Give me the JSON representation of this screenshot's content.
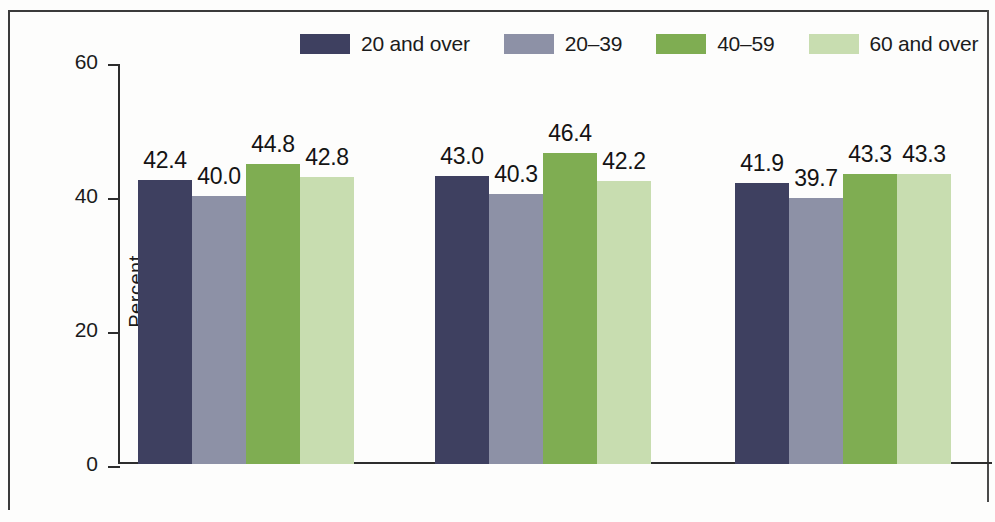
{
  "chart_data": {
    "type": "bar",
    "title": "",
    "subtitle": "",
    "xlabel": "",
    "ylabel": "Percent",
    "ylim": [
      0,
      60
    ],
    "yticks": [
      "0",
      "20",
      "40",
      "60"
    ],
    "ytick_values": [
      0,
      20,
      40,
      60
    ],
    "grid": false,
    "legend_position": "top",
    "categories": [
      "Total",
      "Men",
      "Women"
    ],
    "series": [
      {
        "name": "20 and over",
        "color": "#3e4060",
        "values": [
          42.4,
          43.0,
          41.9
        ],
        "labels": [
          "42.4",
          "43.0",
          "41.9"
        ]
      },
      {
        "name": "20–39",
        "color": "#8d91a6",
        "values": [
          40.0,
          40.3,
          39.7
        ],
        "labels": [
          "40.0",
          "40.3",
          "39.7"
        ]
      },
      {
        "name": "40–59",
        "color": "#7fad52",
        "values": [
          44.8,
          46.4,
          43.3
        ],
        "labels": [
          "44.8",
          "46.4",
          "43.3"
        ]
      },
      {
        "name": "60 and over",
        "color": "#c8ddb0",
        "values": [
          42.8,
          42.2,
          43.3
        ],
        "labels": [
          "42.8",
          "42.2",
          "43.3"
        ]
      }
    ]
  }
}
